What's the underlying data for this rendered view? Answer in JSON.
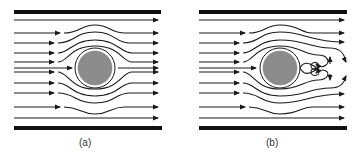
{
  "figure": {
    "panels": [
      {
        "id": "a",
        "label": "(a)",
        "description": "Streamlines of flow past a circular cylinder between parallel walls, symmetric, no wake"
      },
      {
        "id": "b",
        "label": "(b)",
        "description": "Streamlines of flow past a circular cylinder between parallel walls, with a pair of recirculating vortices in the wake"
      }
    ],
    "colors": {
      "line": "#1a1a1a",
      "cylinder_fill": "#8c8c8c",
      "wall": "#111111",
      "background": "#ffffff"
    }
  }
}
